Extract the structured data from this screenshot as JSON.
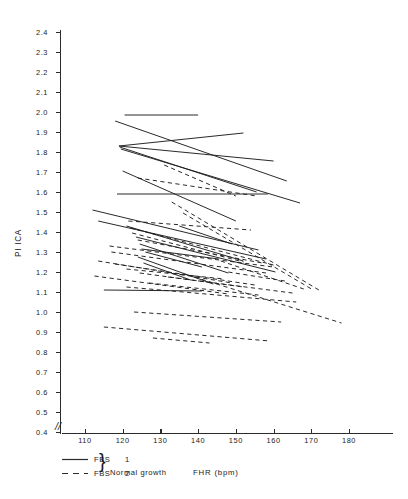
{
  "chart_data": {
    "type": "line",
    "title": "",
    "subtitle": "",
    "xlabel": "FHR (bpm)",
    "ylabel": "PI ICA",
    "xlim": [
      104,
      188
    ],
    "ylim": [
      0.4,
      2.4
    ],
    "grid": false,
    "axis_break_y": true,
    "axis_break_marker": "//",
    "legend_position": "below-axis-left",
    "x_ticks": [
      110,
      120,
      130,
      140,
      150,
      160,
      170,
      180
    ],
    "y_ticks": [
      0.4,
      0.5,
      0.6,
      0.7,
      0.8,
      0.9,
      1.0,
      1.1,
      1.2,
      1.3,
      1.4,
      1.5,
      1.6,
      1.7,
      1.8,
      1.9,
      2.0,
      2.1,
      2.2,
      2.3,
      2.4
    ],
    "y_tick_labels": [
      "0.4",
      "0.5",
      "0.6",
      "0.7",
      "0.8",
      "0.9",
      "1.0",
      "1.1",
      "1.2",
      "1.3",
      "1.4",
      "1.5",
      "1.6",
      "1.7",
      "1.8",
      "1.9",
      "2.0",
      "2.1",
      "2.2",
      "2.3",
      "2.4"
    ],
    "x_tick_labels": [
      "110",
      "120",
      "130",
      "140",
      "150",
      "160",
      "170",
      "180"
    ],
    "legend": [
      {
        "label": "FBS",
        "number": "1",
        "style": "solid",
        "group": "Normal growth"
      },
      {
        "label": "FBS",
        "number": "2",
        "style": "dashed",
        "group": "Normal growth"
      }
    ],
    "series": [
      {
        "name": "FBS 1",
        "style": "solid",
        "description": "Paired FHR / PI ICA segments, first fetal blood sample",
        "segments": [
          {
            "x": [
              120.5,
              140.0
            ],
            "y": [
              1.985,
              1.985
            ]
          },
          {
            "x": [
              118.0,
              163.5
            ],
            "y": [
              1.955,
              1.655
            ]
          },
          {
            "x": [
              119.0,
              152.0
            ],
            "y": [
              1.83,
              1.895
            ]
          },
          {
            "x": [
              119.0,
              160.0
            ],
            "y": [
              1.83,
              1.755
            ]
          },
          {
            "x": [
              119.2,
              155.5
            ],
            "y": [
              1.825,
              1.6
            ]
          },
          {
            "x": [
              119.5,
              167.0
            ],
            "y": [
              1.815,
              1.545
            ]
          },
          {
            "x": [
              120.0,
              150.0
            ],
            "y": [
              1.705,
              1.455
            ]
          },
          {
            "x": [
              118.5,
              158.5
            ],
            "y": [
              1.59,
              1.59
            ]
          },
          {
            "x": [
              112.0,
              156.0
            ],
            "y": [
              1.51,
              1.31
            ]
          },
          {
            "x": [
              113.5,
              158.0
            ],
            "y": [
              1.455,
              1.265
            ]
          },
          {
            "x": [
              121.0,
              152.0
            ],
            "y": [
              1.43,
              1.255
            ]
          },
          {
            "x": [
              123.5,
              160.5
            ],
            "y": [
              1.375,
              1.2
            ]
          },
          {
            "x": [
              124.5,
              148.0
            ],
            "y": [
              1.34,
              1.195
            ]
          },
          {
            "x": [
              125.0,
              145.5
            ],
            "y": [
              1.315,
              1.265
            ]
          },
          {
            "x": [
              126.0,
              141.0
            ],
            "y": [
              1.3,
              1.225
            ]
          },
          {
            "x": [
              124.0,
              144.0
            ],
            "y": [
              1.275,
              1.14
            ]
          },
          {
            "x": [
              125.5,
              138.0
            ],
            "y": [
              1.245,
              1.16
            ]
          },
          {
            "x": [
              115.0,
              141.0
            ],
            "y": [
              1.11,
              1.105
            ]
          },
          {
            "x": [
              135.0,
              149.0
            ],
            "y": [
              1.43,
              1.34
            ]
          }
        ]
      },
      {
        "name": "FBS 2",
        "style": "dashed",
        "description": "Paired FHR / PI ICA segments, second fetal blood sample",
        "segments": [
          {
            "x": [
              131.0,
              150.0
            ],
            "y": [
              1.735,
              1.58
            ]
          },
          {
            "x": [
              124.0,
              155.5
            ],
            "y": [
              1.67,
              1.58
            ]
          },
          {
            "x": [
              133.0,
              172.0
            ],
            "y": [
              1.55,
              1.11
            ]
          },
          {
            "x": [
              136.0,
              170.5
            ],
            "y": [
              1.495,
              1.11
            ]
          },
          {
            "x": [
              121.5,
              154.0
            ],
            "y": [
              1.455,
              1.41
            ]
          },
          {
            "x": [
              122.0,
              160.0
            ],
            "y": [
              1.42,
              1.235
            ]
          },
          {
            "x": [
              122.5,
              152.0
            ],
            "y": [
              1.395,
              1.25
            ]
          },
          {
            "x": [
              124.0,
              157.0
            ],
            "y": [
              1.36,
              1.245
            ]
          },
          {
            "x": [
              116.5,
              160.0
            ],
            "y": [
              1.33,
              1.225
            ]
          },
          {
            "x": [
              117.0,
              158.0
            ],
            "y": [
              1.3,
              1.195
            ]
          },
          {
            "x": [
              113.5,
              149.0
            ],
            "y": [
              1.255,
              1.145
            ]
          },
          {
            "x": [
              118.0,
              155.0
            ],
            "y": [
              1.24,
              1.135
            ]
          },
          {
            "x": [
              121.0,
              147.0
            ],
            "y": [
              1.215,
              1.165
            ]
          },
          {
            "x": [
              124.5,
              152.0
            ],
            "y": [
              1.195,
              1.125
            ]
          },
          {
            "x": [
              112.5,
              148.0
            ],
            "y": [
              1.18,
              1.09
            ]
          },
          {
            "x": [
              132.0,
              165.0
            ],
            "y": [
              1.175,
              1.095
            ]
          },
          {
            "x": [
              139.0,
              178.0
            ],
            "y": [
              1.175,
              0.945
            ]
          },
          {
            "x": [
              127.0,
              156.0
            ],
            "y": [
              1.145,
              1.085
            ]
          },
          {
            "x": [
              121.0,
              166.0
            ],
            "y": [
              1.125,
              1.05
            ]
          },
          {
            "x": [
              123.0,
              162.0
            ],
            "y": [
              1.0,
              0.95
            ]
          },
          {
            "x": [
              115.0,
              159.0
            ],
            "y": [
              0.925,
              0.855
            ]
          },
          {
            "x": [
              128.0,
              143.0
            ],
            "y": [
              0.87,
              0.845
            ]
          },
          {
            "x": [
              146.0,
              168.0
            ],
            "y": [
              1.255,
              1.115
            ]
          },
          {
            "x": [
              148.0,
              163.0
            ],
            "y": [
              1.2,
              1.155
            ]
          }
        ]
      }
    ]
  }
}
